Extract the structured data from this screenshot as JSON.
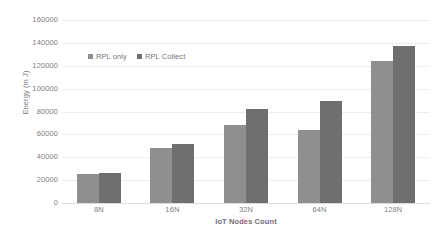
{
  "chart_data": {
    "type": "bar",
    "title": "",
    "xlabel": "IoT Nodes Count",
    "ylabel": "Energy (m J)",
    "categories": [
      "8N",
      "16N",
      "32N",
      "64N",
      "128N"
    ],
    "series": [
      {
        "name": "RPL only",
        "color": "#8f8f8f",
        "values": [
          25500,
          47800,
          68000,
          64000,
          124000
        ]
      },
      {
        "name": "RPL Collect",
        "color": "#6f6f6f",
        "values": [
          26500,
          51500,
          82000,
          89000,
          137500
        ]
      }
    ],
    "ylim": [
      0,
      160000
    ],
    "ytick_values": [
      0,
      20000,
      40000,
      60000,
      80000,
      100000,
      120000,
      140000,
      160000
    ],
    "ytick_labels": [
      "0",
      "20000",
      "40000",
      "60000",
      "80000",
      "100000",
      "120000",
      "140000",
      "160000"
    ],
    "grid": true,
    "legend_position": "inside-top-left",
    "annotations": []
  },
  "caption": ""
}
